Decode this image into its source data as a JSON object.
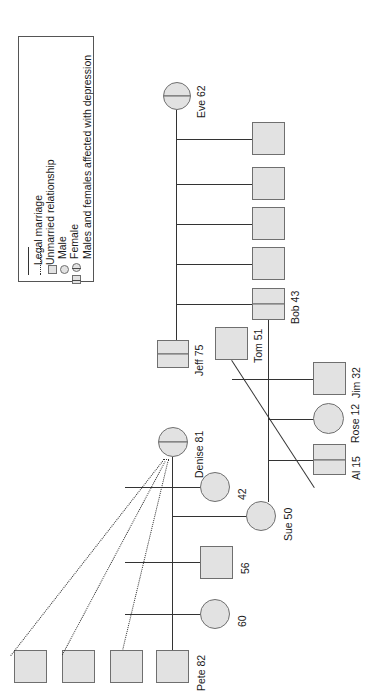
{
  "diagram": {
    "orientation": "rotated-90",
    "colors": {
      "node_fill": "#e2e2e2",
      "node_stroke": "#6f6f6f",
      "line": "#333333",
      "background": "#ffffff"
    }
  },
  "legend": {
    "items": [
      {
        "symbol": "solid-line",
        "label": "Legal marriage"
      },
      {
        "symbol": "dotted-line",
        "label": "Unmarried relationship"
      },
      {
        "symbol": "square",
        "label": "Male"
      },
      {
        "symbol": "circle",
        "label": "Female"
      },
      {
        "symbol": "half-filled-circle-and-square",
        "label": "Males and females affected with depression"
      }
    ]
  },
  "people": [
    {
      "id": "eve",
      "label": "Eve 62",
      "name": "Eve",
      "age": 62,
      "sex": "female",
      "affected": true
    },
    {
      "id": "jeff",
      "label": "Jeff 75",
      "name": "Jeff",
      "age": 75,
      "sex": "male",
      "affected": true
    },
    {
      "id": "bob",
      "label": "Bob 43",
      "name": "Bob",
      "age": 43,
      "sex": "male",
      "affected": true
    },
    {
      "id": "tom",
      "label": "Tom 51",
      "name": "Tom",
      "age": 51,
      "sex": "male",
      "affected": false
    },
    {
      "id": "jim",
      "label": "Jim 32",
      "name": "Jim",
      "age": 32,
      "sex": "male",
      "affected": false
    },
    {
      "id": "rose",
      "label": "Rose 12",
      "name": "Rose",
      "age": 12,
      "sex": "female",
      "affected": false
    },
    {
      "id": "al",
      "label": "Al 15",
      "name": "Al",
      "age": 15,
      "sex": "male",
      "affected": true
    },
    {
      "id": "denise",
      "label": "Denise 81",
      "name": "Denise",
      "age": 81,
      "sex": "female",
      "affected": true
    },
    {
      "id": "sue",
      "label": "Sue 50",
      "name": "Sue",
      "age": 50,
      "sex": "female",
      "affected": false
    },
    {
      "id": "pete",
      "label": "Pete 82",
      "name": "Pete",
      "age": 82,
      "sex": "male",
      "affected": false
    },
    {
      "id": "f42",
      "label": "42",
      "name": "",
      "age": 42,
      "sex": "female",
      "affected": false
    },
    {
      "id": "m56",
      "label": "56",
      "name": "",
      "age": 56,
      "sex": "male",
      "affected": false
    },
    {
      "id": "f60",
      "label": "60",
      "name": "",
      "age": 60,
      "sex": "female",
      "affected": false
    },
    {
      "id": "eve_c1",
      "label": "",
      "name": "",
      "age": null,
      "sex": "male",
      "affected": false
    },
    {
      "id": "eve_c2",
      "label": "",
      "name": "",
      "age": null,
      "sex": "male",
      "affected": false
    },
    {
      "id": "eve_c3",
      "label": "",
      "name": "",
      "age": null,
      "sex": "male",
      "affected": false
    },
    {
      "id": "eve_c4",
      "label": "",
      "name": "",
      "age": null,
      "sex": "male",
      "affected": false
    },
    {
      "id": "den_p1",
      "label": "",
      "name": "",
      "age": null,
      "sex": "male",
      "affected": false
    },
    {
      "id": "den_p2",
      "label": "",
      "name": "",
      "age": null,
      "sex": "male",
      "affected": false
    },
    {
      "id": "den_p3",
      "label": "",
      "name": "",
      "age": null,
      "sex": "male",
      "affected": false
    }
  ],
  "relationships": [
    {
      "type": "legal-marriage",
      "from": "eve",
      "to": "jeff"
    },
    {
      "type": "legal-marriage",
      "from": "denise",
      "to": "pete"
    },
    {
      "type": "unmarried-relationship",
      "from": "denise",
      "to": "den_p1"
    },
    {
      "type": "unmarried-relationship",
      "from": "denise",
      "to": "den_p2"
    },
    {
      "type": "unmarried-relationship",
      "from": "denise",
      "to": "den_p3"
    },
    {
      "type": "legal-marriage",
      "from": "tom",
      "to": "sue"
    },
    {
      "type": "parent-child",
      "from": "eve",
      "to": "eve_c1"
    },
    {
      "type": "parent-child",
      "from": "eve",
      "to": "eve_c2"
    },
    {
      "type": "parent-child",
      "from": "eve",
      "to": "eve_c3"
    },
    {
      "type": "parent-child",
      "from": "eve",
      "to": "eve_c4"
    },
    {
      "type": "parent-child",
      "from": "eve",
      "to": "bob"
    },
    {
      "type": "parent-child",
      "from": "bob",
      "to": "jim"
    },
    {
      "type": "parent-child",
      "from": "bob",
      "to": "rose"
    },
    {
      "type": "parent-child",
      "from": "bob",
      "to": "al"
    },
    {
      "type": "parent-child",
      "from": "denise",
      "to": "f42"
    },
    {
      "type": "parent-child",
      "from": "denise",
      "to": "sue"
    },
    {
      "type": "parent-child",
      "from": "denise",
      "to": "m56"
    },
    {
      "type": "parent-child",
      "from": "denise",
      "to": "f60"
    }
  ]
}
